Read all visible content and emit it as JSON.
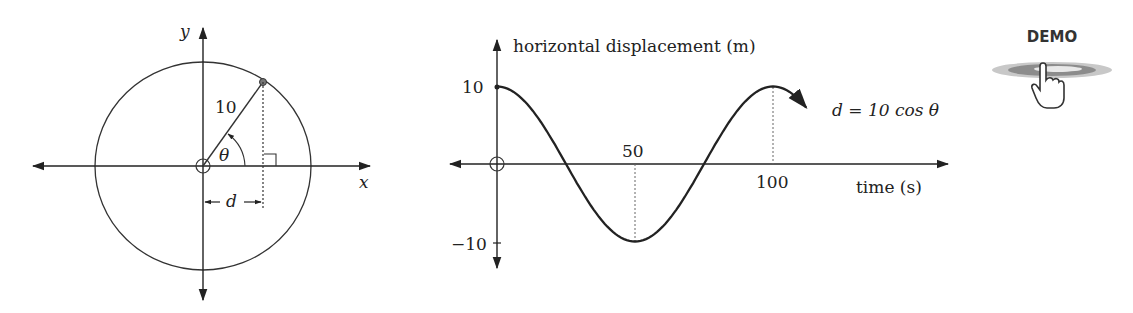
{
  "circle_diagram": {
    "x_label": "x",
    "y_label": "y",
    "radius_label": "10",
    "angle_label": "θ",
    "distance_label": "d"
  },
  "graph": {
    "y_axis_label": "horizontal displacement (m)",
    "x_axis_label": "time (s)",
    "y_tick_top": "10",
    "y_tick_bottom": "−10",
    "x_tick_50": "50",
    "x_tick_100": "100",
    "equation": "d = 10 cos θ"
  },
  "demo_button": {
    "label": "DEMO"
  },
  "chart_data": {
    "type": "line",
    "title": "",
    "xlabel": "time (s)",
    "ylabel": "horizontal displacement (m)",
    "x": [
      0,
      12.5,
      25,
      37.5,
      50,
      62.5,
      75,
      87.5,
      100,
      112
    ],
    "series": [
      {
        "name": "d = 10 cos θ",
        "values": [
          10,
          7.07,
          0,
          -7.07,
          -10,
          -7.07,
          0,
          7.07,
          10,
          6
        ]
      }
    ],
    "x_ticks": [
      50,
      100
    ],
    "y_ticks": [
      10,
      -10
    ],
    "ylim": [
      -10,
      10
    ],
    "grid": false
  }
}
